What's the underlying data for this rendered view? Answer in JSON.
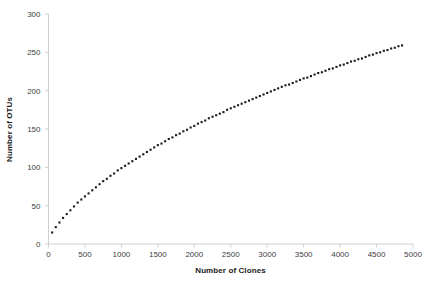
{
  "chart_data": {
    "type": "scatter",
    "title": "",
    "subtitle": "",
    "xlabel": "Number of Clones",
    "ylabel": "Number of OTUs",
    "xlim": [
      0,
      5000
    ],
    "ylim": [
      0,
      300
    ],
    "xticks": [
      0,
      500,
      1000,
      1500,
      2000,
      2500,
      3000,
      3500,
      4000,
      4500,
      5000
    ],
    "yticks": [
      0,
      50,
      100,
      150,
      200,
      250,
      300
    ],
    "grid": false,
    "legend": null,
    "marker": "square",
    "marker_color": "#1a1a1a",
    "marker_size": 2.1,
    "annotations": [],
    "series": [
      {
        "name": "Rarefaction curve",
        "x": [
          50,
          100,
          150,
          200,
          250,
          300,
          350,
          400,
          450,
          500,
          550,
          600,
          650,
          700,
          750,
          800,
          850,
          900,
          950,
          1000,
          1050,
          1100,
          1150,
          1200,
          1250,
          1300,
          1350,
          1400,
          1450,
          1500,
          1550,
          1600,
          1650,
          1700,
          1750,
          1800,
          1850,
          1900,
          1950,
          2000,
          2050,
          2100,
          2150,
          2200,
          2250,
          2300,
          2350,
          2400,
          2450,
          2500,
          2550,
          2600,
          2650,
          2700,
          2750,
          2800,
          2850,
          2900,
          2950,
          3000,
          3050,
          3100,
          3150,
          3200,
          3250,
          3300,
          3350,
          3400,
          3450,
          3500,
          3550,
          3600,
          3650,
          3700,
          3750,
          3800,
          3850,
          3900,
          3950,
          4000,
          4050,
          4100,
          4150,
          4200,
          4250,
          4300,
          4350,
          4400,
          4450,
          4500,
          4550,
          4600,
          4650,
          4700,
          4750,
          4800,
          4850
        ],
        "y": [
          15,
          22,
          28,
          34,
          39,
          44,
          49,
          54,
          58,
          62,
          66,
          70,
          74,
          78,
          82,
          85,
          89,
          92,
          96,
          99,
          102,
          105,
          108,
          111,
          114,
          117,
          120,
          123,
          126,
          129,
          131,
          134,
          137,
          139,
          142,
          144,
          147,
          149,
          152,
          154,
          157,
          159,
          161,
          164,
          166,
          168,
          170,
          172,
          175,
          177,
          179,
          181,
          183,
          185,
          187,
          189,
          191,
          193,
          195,
          197,
          199,
          201,
          203,
          205,
          207,
          208,
          210,
          212,
          214,
          216,
          217,
          219,
          221,
          223,
          224,
          226,
          228,
          229,
          231,
          233,
          234,
          236,
          238,
          239,
          241,
          242,
          244,
          246,
          247,
          249,
          250,
          252,
          253,
          255,
          256,
          258,
          259
        ]
      }
    ]
  },
  "axes": {
    "axis_line_color": "#d0d0d0",
    "tick_color": "#d0d0d0",
    "tick_label_color": "#3d3d3d",
    "background": "#ffffff"
  }
}
